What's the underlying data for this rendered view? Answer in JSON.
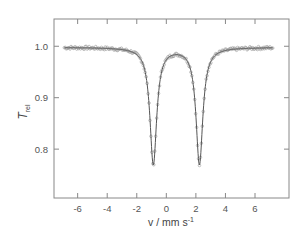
{
  "chart_data": {
    "type": "scatter",
    "title": "",
    "xlabel": "v / mm s",
    "xlabel_superscript": "-1",
    "ylabel": "T",
    "ylabel_subscript": "rel",
    "xlim": [
      -7.6,
      8.3
    ],
    "ylim": [
      0.705,
      1.053
    ],
    "xticks": [
      -6,
      -4,
      -2,
      0,
      2,
      4,
      6
    ],
    "xtick_labels": [
      "-6",
      "-4",
      "-2",
      "0",
      "2",
      "4",
      "6"
    ],
    "yticks": [
      0.8,
      0.9,
      1.0
    ],
    "ytick_labels": [
      "0.8",
      "0.9",
      "1.0"
    ],
    "grid": false,
    "legend": null,
    "series": [
      {
        "name": "Experimental data",
        "style": "open-circle markers",
        "model": "two Lorentzian absorption lines",
        "x_range": [
          -6.9,
          7.2
        ],
        "baseline": 0.998,
        "lines": [
          {
            "center": -0.88,
            "min_value": 0.771
          },
          {
            "center": 2.24,
            "min_value": 0.771
          }
        ]
      },
      {
        "name": "Fit",
        "style": "solid line",
        "baseline": 0.998,
        "lines": [
          {
            "center": -0.88,
            "depth": 0.227,
            "hwhm": 0.28
          },
          {
            "center": 2.24,
            "depth": 0.227,
            "hwhm": 0.28
          }
        ],
        "center_local_max": {
          "x": 0.68,
          "y": 0.985
        }
      }
    ]
  },
  "colors": {
    "axis": "#888888",
    "fit_line": "#555555",
    "markers": "#999999",
    "text": "#555555"
  }
}
